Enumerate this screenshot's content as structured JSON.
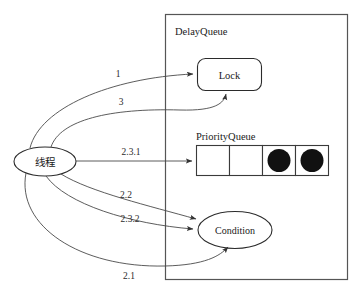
{
  "diagram": {
    "container": {
      "label": "DelayQueue"
    },
    "nodes": [
      {
        "id": "thread",
        "label": "线程",
        "shape": "ellipse"
      },
      {
        "id": "lock",
        "label": "Lock",
        "shape": "rounded-rect"
      },
      {
        "id": "priorityqueue",
        "label": "PriorityQueue",
        "shape": "cell-array"
      },
      {
        "id": "condition",
        "label": "Condition",
        "shape": "ellipse"
      }
    ],
    "queue": {
      "label": "PriorityQueue",
      "cells": [
        {
          "filled": false
        },
        {
          "filled": false
        },
        {
          "filled": true
        },
        {
          "filled": true
        }
      ]
    },
    "edges": [
      {
        "id": "e1",
        "label": "1",
        "from": "thread",
        "to": "lock"
      },
      {
        "id": "e3",
        "label": "3",
        "from": "thread",
        "to": "lock"
      },
      {
        "id": "e231",
        "label": "2.3.1",
        "from": "thread",
        "to": "priorityqueue"
      },
      {
        "id": "e22",
        "label": "2.2",
        "from": "thread",
        "to": "condition"
      },
      {
        "id": "e232",
        "label": "2.3.2",
        "from": "thread",
        "to": "condition"
      },
      {
        "id": "e21",
        "label": "2.1",
        "from": "thread",
        "to": "condition"
      }
    ],
    "colors": {
      "background": "#ffffff",
      "stroke": "#2b2b2b",
      "edge": "#4a4a4a",
      "container_stroke": "#555555",
      "dot_fill": "#111111",
      "text": "#1a1a1a"
    }
  }
}
